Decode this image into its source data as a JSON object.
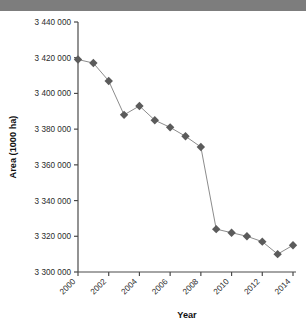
{
  "title_band": {
    "partial_text": "· ·      ·"
  },
  "colors": {
    "marker": "#5b5b5b",
    "line": "#8c8c8c",
    "axis": "#4a4a4a",
    "band": "#7d7d7d",
    "background": "#ffffff"
  },
  "chart_data": {
    "type": "line",
    "title": "",
    "xlabel": "Year",
    "ylabel": "Area (1000 ha)",
    "x": [
      2000,
      2001,
      2002,
      2003,
      2004,
      2005,
      2006,
      2007,
      2008,
      2009,
      2010,
      2011,
      2012,
      2013,
      2014
    ],
    "values": [
      3419000,
      3417000,
      3407000,
      3388000,
      3393000,
      3385000,
      3381000,
      3376000,
      3370000,
      3324000,
      3322000,
      3320000,
      3317000,
      3310000,
      3315000
    ],
    "xlim": [
      2000,
      2014
    ],
    "ylim": [
      3300000,
      3440000
    ],
    "yticks": [
      3300000,
      3320000,
      3340000,
      3360000,
      3380000,
      3400000,
      3420000,
      3440000
    ],
    "ytick_labels": [
      "3 300 000",
      "3 320 000",
      "3 340 000",
      "3 360 000",
      "3 380 000",
      "3 400 000",
      "3 420 000",
      "3 440 000"
    ],
    "xticks": [
      2000,
      2002,
      2004,
      2006,
      2008,
      2010,
      2012,
      2014
    ],
    "xtick_labels": [
      "2000",
      "2002",
      "2004",
      "2006",
      "2008",
      "2010",
      "2012",
      "2014"
    ],
    "xtick_rotation": 45,
    "grid": false,
    "legend": false,
    "marker": "diamond",
    "series": [
      {
        "name": "Area",
        "values": [
          3419000,
          3417000,
          3407000,
          3388000,
          3393000,
          3385000,
          3381000,
          3376000,
          3370000,
          3324000,
          3322000,
          3320000,
          3317000,
          3310000,
          3315000
        ]
      }
    ]
  }
}
